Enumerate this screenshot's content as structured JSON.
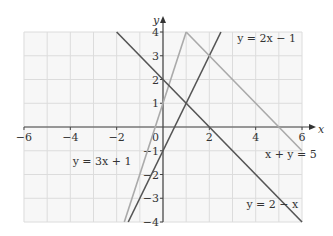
{
  "chart_data": {
    "type": "line",
    "title": "",
    "xlabel": "x",
    "ylabel": "y",
    "xlim": [
      -6,
      6
    ],
    "ylim": [
      -4,
      4
    ],
    "grid": true,
    "x_ticks": [
      -6,
      -4,
      -2,
      2,
      4,
      6
    ],
    "y_ticks": [
      4,
      3,
      2,
      1,
      -1,
      -2,
      -3,
      -4
    ],
    "origin_label": "0",
    "x_tick_labels": [
      "−6",
      "−4",
      "−2",
      "2",
      "4",
      "6"
    ],
    "y_tick_labels": [
      "4",
      "3",
      "2",
      "1",
      "−1",
      "−2",
      "−3",
      "−4"
    ],
    "series": [
      {
        "name": "y = 2x − 1",
        "color": "#555555",
        "points": [
          [
            -1.5,
            -4
          ],
          [
            2.5,
            4
          ]
        ]
      },
      {
        "name": "y = 3x + 1",
        "color": "#aaaaaa",
        "points": [
          [
            -1.67,
            -4
          ],
          [
            1,
            4
          ]
        ]
      },
      {
        "name": "x + y = 5",
        "color": "#aaaaaa",
        "points": [
          [
            1,
            4
          ],
          [
            6,
            -1
          ]
        ]
      },
      {
        "name": "y = 2 − x",
        "color": "#555555",
        "points": [
          [
            -2,
            4
          ],
          [
            6,
            -4
          ]
        ]
      }
    ],
    "annotations": [
      {
        "text": "y = 2x − 1",
        "x": 3.2,
        "y": 3.6
      },
      {
        "text": "y = 3x + 1",
        "x": -3.9,
        "y": -1.6
      },
      {
        "text": "x + y = 5",
        "x": 4.4,
        "y": -1.3
      },
      {
        "text": "y = 2 − x",
        "x": 3.6,
        "y": -3.4
      }
    ]
  }
}
